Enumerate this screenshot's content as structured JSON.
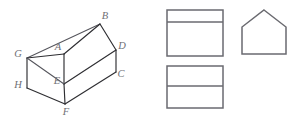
{
  "figure": {
    "background_color": "#ffffff",
    "line_color": "#2e2e32",
    "view_line_color": "#6a6a70",
    "label_color": "#6f6f75",
    "solid": {
      "name": "house-prism",
      "description": "Oblique pictorial of a pentagonal (house-shaped) prism with eight labelled vertices",
      "vertices": [
        {
          "label": "A",
          "x": 58,
          "y": 48,
          "point_x": 64,
          "point_y": 54
        },
        {
          "label": "B",
          "x": 105,
          "y": 17,
          "point_x": 100,
          "point_y": 24
        },
        {
          "label": "C",
          "x": 121,
          "y": 75,
          "point_x": 116,
          "point_y": 72
        },
        {
          "label": "D",
          "x": 122,
          "y": 47,
          "point_x": 116,
          "point_y": 50
        },
        {
          "label": "E",
          "x": 57,
          "y": 82,
          "point_x": 64,
          "point_y": 84
        },
        {
          "label": "F",
          "x": 66,
          "y": 113,
          "point_x": 65,
          "point_y": 104
        },
        {
          "label": "G",
          "x": 18,
          "y": 55,
          "point_x": 27,
          "point_y": 58
        },
        {
          "label": "H",
          "x": 18,
          "y": 86,
          "point_x": 27,
          "point_y": 88
        }
      ],
      "edges": [
        {
          "from": "G",
          "to": "B",
          "kind": "ridge-back"
        },
        {
          "from": "G",
          "to": "A",
          "kind": "roof-left"
        },
        {
          "from": "A",
          "to": "B",
          "kind": "ridge-front"
        },
        {
          "from": "A",
          "to": "E",
          "kind": "roof-slope"
        },
        {
          "from": "E",
          "to": "D",
          "kind": "eave-front"
        },
        {
          "from": "B",
          "to": "D",
          "kind": "roof-right"
        },
        {
          "from": "D",
          "to": "C",
          "kind": "edge-right-vertical"
        },
        {
          "from": "E",
          "to": "F",
          "kind": "wall-front-vertical"
        },
        {
          "from": "F",
          "to": "C",
          "kind": "base-front-right"
        },
        {
          "from": "F",
          "to": "H",
          "kind": "base-front-left"
        },
        {
          "from": "H",
          "to": "G",
          "kind": "wall-left-vertical"
        },
        {
          "from": "G",
          "to": "E",
          "kind": "gable-edge"
        }
      ]
    },
    "views": [
      {
        "name": "front-view",
        "shape": "rectangle-divided",
        "x": 167,
        "y": 10,
        "width": 56,
        "height": 46,
        "divider_offset": 12,
        "divider_count": 1
      },
      {
        "name": "side-view-pentagon",
        "shape": "pentagon",
        "x": 242,
        "y": 10,
        "width": 44,
        "height": 44,
        "apex_offset": 0.5,
        "roof_height": 17
      },
      {
        "name": "top-view",
        "shape": "rectangle-divided",
        "x": 167,
        "y": 66,
        "width": 56,
        "height": 42,
        "divider_offset": 20,
        "divider_count": 1
      }
    ]
  }
}
